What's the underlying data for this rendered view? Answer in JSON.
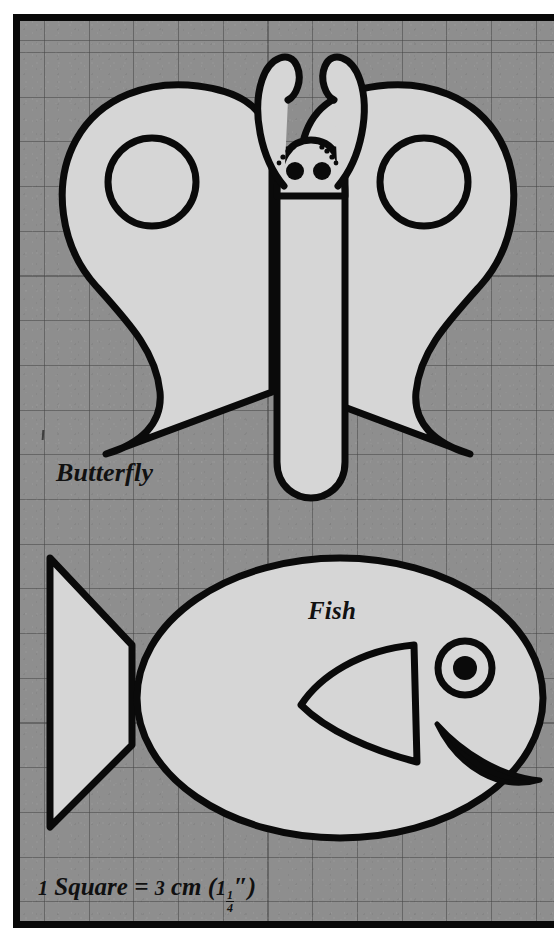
{
  "page": {
    "background_color": "#ffffff",
    "panel_color": "#8e8e8e",
    "grid_line_color": "#464646",
    "ink_color": "#080808",
    "shape_fill_color": "#d4d4d4",
    "grid_square_px": 44.7
  },
  "labels": {
    "butterfly": "Butterfly",
    "fish": "Fish"
  },
  "scale_caption": {
    "quantity": "1",
    "unit_word": "Square",
    "equals": "=",
    "metric_value": "3",
    "metric_unit": "cm",
    "imperial_open": "(",
    "imperial_whole": "1",
    "imperial_numerator": "1",
    "imperial_denominator": "4",
    "imperial_inch_mark": "″",
    "imperial_close": ")",
    "full_text": "1 Square = 3 cm (1 1/4″)"
  },
  "figures": [
    {
      "name": "butterfly",
      "label": "Butterfly",
      "parts": [
        "left-wing",
        "right-wing",
        "left-wing-circle",
        "right-wing-circle",
        "body",
        "head",
        "left-antenna",
        "right-antenna",
        "left-eye",
        "right-eye",
        "left-brow-dashes",
        "right-brow-dashes"
      ]
    },
    {
      "name": "fish",
      "label": "Fish",
      "parts": [
        "body-ellipse",
        "tail",
        "fin",
        "eye-ring",
        "eye-pupil",
        "mouth"
      ]
    }
  ]
}
